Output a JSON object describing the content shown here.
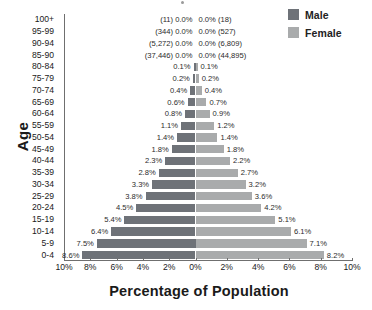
{
  "chart_data": {
    "type": "bar",
    "subtype": "population-pyramid",
    "title": "",
    "xlabel": "Percentage of Population",
    "ylabel": "Age",
    "categories": [
      "100+",
      "95-99",
      "90-94",
      "85-90",
      "80-84",
      "75-79",
      "70-74",
      "65-69",
      "60-64",
      "55-59",
      "50-54",
      "45-49",
      "40-44",
      "35-39",
      "30-34",
      "25-29",
      "20-24",
      "15-19",
      "10-14",
      "5-9",
      "0-4"
    ],
    "x_tick_labels": [
      "10%",
      "8%",
      "6%",
      "4%",
      "2%",
      "0%",
      "2%",
      "4%",
      "6%",
      "8%",
      "10%"
    ],
    "x_tick_values": [
      -10,
      -8,
      -6,
      -4,
      -2,
      0,
      2,
      4,
      6,
      8,
      10
    ],
    "xlim": [
      -10,
      10
    ],
    "grid": false,
    "legend_position": "top-right",
    "series": [
      {
        "name": "Male",
        "color": "#6e7278",
        "side": "left",
        "values": [
          0.0,
          0.0,
          0.0,
          0.0,
          0.1,
          0.2,
          0.4,
          0.6,
          0.8,
          1.1,
          1.4,
          1.8,
          2.3,
          2.8,
          3.3,
          3.8,
          4.5,
          5.4,
          6.4,
          7.5,
          8.6
        ],
        "labels": [
          "(11) 0.0%",
          "(344) 0.0%",
          "(5,272) 0.0%",
          "(37,446) 0.0%",
          "0.1%",
          "0.2%",
          "0.4%",
          "0.6%",
          "0.8%",
          "1.1%",
          "1.4%",
          "1.8%",
          "2.3%",
          "2.8%",
          "3.3%",
          "3.8%",
          "4.5%",
          "5.4%",
          "6.4%",
          "7.5%",
          "8.6%"
        ]
      },
      {
        "name": "Female",
        "color": "#a9abac",
        "side": "right",
        "values": [
          0.0,
          0.0,
          0.0,
          0.0,
          0.1,
          0.2,
          0.4,
          0.7,
          0.9,
          1.2,
          1.4,
          1.8,
          2.2,
          2.7,
          3.2,
          3.6,
          4.2,
          5.1,
          6.1,
          7.1,
          8.2
        ],
        "labels": [
          "0.0% (18)",
          "0.0% (527)",
          "0.0% (6,809)",
          "0.0% (44,895)",
          "0.1%",
          "0.2%",
          "0.4%",
          "0.7%",
          "0.9%",
          "1.2%",
          "1.4%",
          "1.8%",
          "2.2%",
          "2.7%",
          "3.2%",
          "3.6%",
          "4.2%",
          "5.1%",
          "6.1%",
          "7.1%",
          "8.2%"
        ]
      }
    ]
  },
  "legend": {
    "items": [
      {
        "label": "Male",
        "color": "#6e7278"
      },
      {
        "label": "Female",
        "color": "#a9abac"
      }
    ]
  },
  "axes": {
    "y_title": "Age",
    "x_title": "Percentage of Population"
  }
}
